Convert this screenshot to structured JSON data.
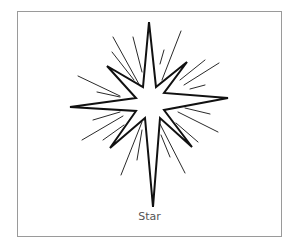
{
  "figure": {
    "caption": "Star",
    "icon": "star-icon",
    "colors": {
      "line": "#111111",
      "border": "#9a9a9a",
      "caption": "#555555",
      "background": "#ffffff"
    }
  }
}
